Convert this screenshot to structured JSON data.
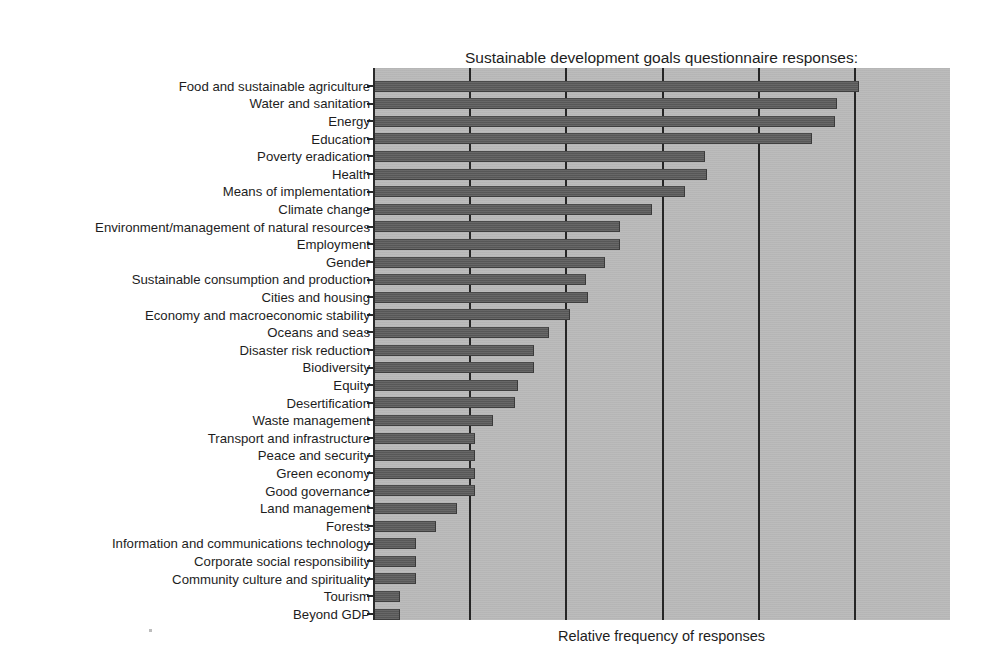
{
  "chart_data": {
    "type": "bar",
    "orientation": "horizontal",
    "title": "Sustainable development goals questionnaire responses:\nPriority areas mentioned by member states",
    "title_lines": [
      "Sustainable development goals questionnaire responses:",
      "Priority areas mentioned by member states"
    ],
    "xlabel": "Relative frequency of responses",
    "ylabel": "",
    "xlim": [
      0,
      6.0
    ],
    "ylim": null,
    "grid": "vertical gridlines at x = 1, 2, 3, 4, 5",
    "gridlines": [
      1,
      2,
      3,
      4,
      5
    ],
    "xticks_labeled": false,
    "legend": "none",
    "bar_color": "#5c5c5c",
    "plot_background_color": "#b9b9b9",
    "axis_color": "#262626",
    "categories": [
      "Food and sustainable agriculture",
      "Water and sanitation",
      "Energy",
      "Education",
      "Poverty eradication",
      "Health",
      "Means of implementation",
      "Climate change",
      "Environment/management of natural resources",
      "Employment",
      "Gender",
      "Sustainable consumption and production",
      "Cities and housing",
      "Economy and macroeconomic stability",
      "Oceans and seas",
      "Disaster risk reduction",
      "Biodiversity",
      "Equity",
      "Desertification",
      "Waste management",
      "Transport and infrastructure",
      "Peace and security",
      "Green economy",
      "Good governance",
      "Land management",
      "Forests",
      "Information and communications technology",
      "Corporate social responsibility",
      "Community culture and spirituality",
      "Tourism",
      "Beyond GDP"
    ],
    "values": [
      5.05,
      4.82,
      4.8,
      4.57,
      3.45,
      3.47,
      3.24,
      2.9,
      2.57,
      2.57,
      2.41,
      2.22,
      2.24,
      2.05,
      1.83,
      1.67,
      1.67,
      1.51,
      1.48,
      1.25,
      1.06,
      1.06,
      1.06,
      1.06,
      0.87,
      0.66,
      0.45,
      0.45,
      0.45,
      0.28,
      0.28
    ],
    "value_unit": "relative frequency (arbitrary units, unlabeled axis)",
    "n_categories": 31
  },
  "figure": {
    "x_axis_label": "Relative frequency of responses"
  }
}
